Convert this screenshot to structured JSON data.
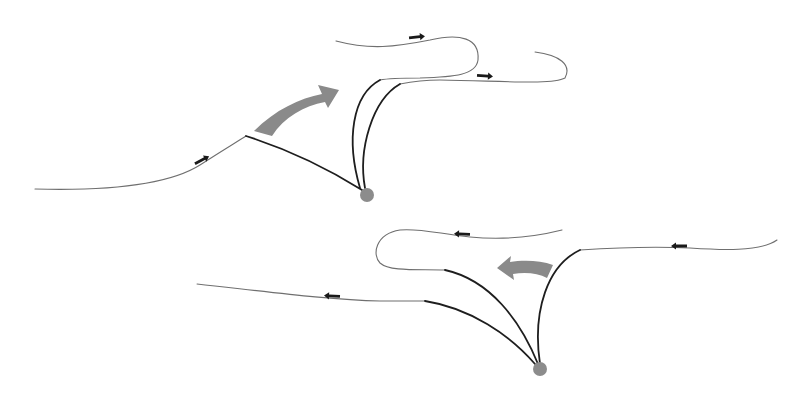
{
  "diagram": {
    "width": 810,
    "height": 394,
    "background": "#ffffff",
    "colors": {
      "thin_line": "#6f6f6f",
      "thick_line": "#1e1e1e",
      "flow_arrow": "#1a1a1a",
      "motion_arrow": "#8a8a8a",
      "footpoint": "#8c8c8c"
    },
    "panels": [
      {
        "id": "top-panel",
        "footpoint": {
          "cx": 367,
          "cy": 195,
          "r": 7
        },
        "field_lines": [
          {
            "id": "top-line-left",
            "thin": "M35,189 C110,191 170,184 200,165 C220,152 235,143 246,136",
            "thick": "M246,136 C290,150 330,170 362,190"
          },
          {
            "id": "top-line-upper",
            "thin": "M336,41 C370,50 395,47 430,40 C460,33 480,38 478,60 C476,75 455,77 420,78 C400,78 385,79 380,80",
            "thick": "M380,80 C352,95 346,140 360,188"
          },
          {
            "id": "top-line-lower",
            "thin": "M535,52 C560,55 572,65 565,78 C552,85 505,81 440,80 C420,80 410,82 400,84",
            "thick": "M400,84 C372,100 358,150 365,188"
          }
        ],
        "flow_arrows": [
          {
            "id": "top-arrow-1",
            "x": 202,
            "y": 160,
            "angle": -28,
            "direction": "right"
          },
          {
            "id": "top-arrow-2",
            "x": 417,
            "y": 37,
            "angle": -6,
            "direction": "right"
          },
          {
            "id": "top-arrow-3",
            "x": 485,
            "y": 76,
            "angle": 4,
            "direction": "right"
          }
        ],
        "motion_arrow": {
          "id": "top-motion-arrow",
          "direction": "up-right",
          "path": "M254,131 C275,110 300,98 322,94 L318,85 L339,90 L328,108 L325,102 C304,106 284,117 272,136 Z"
        }
      },
      {
        "id": "bottom-panel",
        "footpoint": {
          "cx": 540,
          "cy": 369,
          "r": 7
        },
        "field_lines": [
          {
            "id": "bottom-line-left",
            "thin": "M197,284 C270,292 330,300 380,301 C400,301 415,301 425,301",
            "thick": "M425,301 C470,308 510,335 535,364"
          },
          {
            "id": "bottom-line-loop",
            "thin": "M562,230 C530,238 500,240 470,237 C440,234 420,228 400,230 C375,234 372,255 380,263 C390,272 420,269 445,270",
            "thick": "M445,270 C490,280 520,320 538,364"
          },
          {
            "id": "bottom-line-right",
            "thin": "M777,240 C760,252 720,250 690,248 C650,246 610,248 580,250",
            "thick": "M580,250 C548,265 532,310 540,364"
          }
        ],
        "flow_arrows": [
          {
            "id": "bottom-arrow-1",
            "x": 462,
            "y": 234,
            "angle": 2,
            "direction": "left"
          },
          {
            "id": "bottom-arrow-2",
            "x": 332,
            "y": 296,
            "angle": 3,
            "direction": "left"
          },
          {
            "id": "bottom-arrow-3",
            "x": 679,
            "y": 246,
            "angle": 0,
            "direction": "left"
          }
        ],
        "motion_arrow": {
          "id": "bottom-motion-arrow",
          "direction": "left",
          "path": "M553,265 C540,260 522,260 510,262 L511,256 L497,268 L514,280 L513,274 C525,272 538,273 547,278 Z"
        }
      }
    ]
  }
}
